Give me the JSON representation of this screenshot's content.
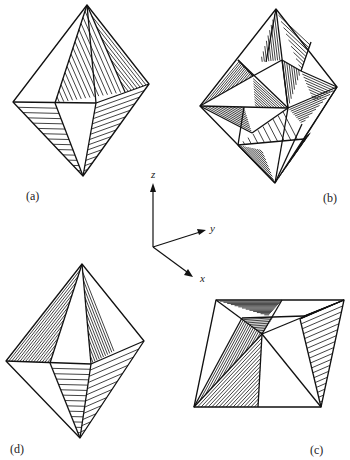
{
  "figure": {
    "panels": [
      {
        "id": "a",
        "label": "(a)"
      },
      {
        "id": "b",
        "label": "(b)"
      },
      {
        "id": "c",
        "label": "(c)"
      },
      {
        "id": "d",
        "label": "(d)"
      }
    ],
    "axes": {
      "x": "x",
      "y": "y",
      "z": "z"
    },
    "colors": {
      "line": "#111111",
      "background": "#ffffff"
    }
  }
}
